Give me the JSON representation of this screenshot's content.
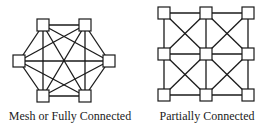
{
  "diagrams": [
    {
      "id": "mesh",
      "caption": "Mesh or Fully Connected",
      "caption_x": 70,
      "nodes": [
        {
          "name": "top-left",
          "x": 43,
          "y": 25
        },
        {
          "name": "top-right",
          "x": 85,
          "y": 25
        },
        {
          "name": "left",
          "x": 19,
          "y": 61
        },
        {
          "name": "right",
          "x": 109,
          "y": 61
        },
        {
          "name": "bottom-left",
          "x": 43,
          "y": 96
        },
        {
          "name": "bottom-right",
          "x": 85,
          "y": 96
        }
      ],
      "edges": "all-pairs"
    },
    {
      "id": "partial",
      "caption": "Partially Connected",
      "caption_x": 207,
      "nodes": [
        {
          "name": "r0c0",
          "x": 164,
          "y": 13
        },
        {
          "name": "r0c1",
          "x": 206,
          "y": 13
        },
        {
          "name": "r0c2",
          "x": 248,
          "y": 13
        },
        {
          "name": "r1c0",
          "x": 164,
          "y": 54
        },
        {
          "name": "r1c1",
          "x": 206,
          "y": 54
        },
        {
          "name": "r1c2",
          "x": 248,
          "y": 54
        },
        {
          "name": "r2c0",
          "x": 164,
          "y": 95
        },
        {
          "name": "r2c1",
          "x": 206,
          "y": 95
        },
        {
          "name": "r2c2",
          "x": 248,
          "y": 95
        }
      ],
      "edges": [
        [
          0,
          1
        ],
        [
          1,
          2
        ],
        [
          3,
          4
        ],
        [
          4,
          5
        ],
        [
          6,
          7
        ],
        [
          7,
          8
        ],
        [
          0,
          3
        ],
        [
          3,
          6
        ],
        [
          1,
          4
        ],
        [
          4,
          7
        ],
        [
          2,
          5
        ],
        [
          5,
          8
        ],
        [
          0,
          4
        ],
        [
          1,
          3
        ],
        [
          1,
          5
        ],
        [
          2,
          4
        ],
        [
          3,
          7
        ],
        [
          4,
          6
        ],
        [
          4,
          8
        ],
        [
          5,
          7
        ]
      ]
    }
  ],
  "style": {
    "line_color": "#1a1a1a",
    "node_fill": "#ffffff",
    "node_stroke": "#1a1a1a",
    "node_size": 12
  }
}
